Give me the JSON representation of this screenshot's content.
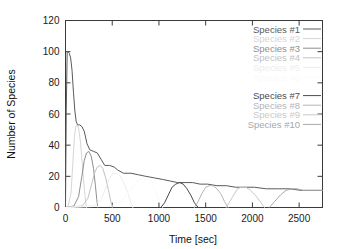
{
  "chart_data": {
    "type": "line",
    "title": "",
    "xlabel": "Time [sec]",
    "ylabel": "Number of Species",
    "xlim": [
      0,
      2750
    ],
    "ylim": [
      0,
      120
    ],
    "xticks": [
      0,
      500,
      1000,
      1500,
      2000,
      2500
    ],
    "yticks": [
      0,
      20,
      40,
      60,
      80,
      100,
      120
    ],
    "grid": false,
    "legend_position": "top-right",
    "series": [
      {
        "name": "Species #1",
        "color": "#5a5a5a",
        "x": [
          0,
          8,
          18,
          28,
          40,
          55,
          70,
          85,
          100,
          115,
          130,
          150,
          175,
          200,
          230,
          260,
          300,
          340,
          380,
          420,
          470,
          520,
          560,
          620,
          700,
          780,
          860,
          950,
          1040,
          1120,
          1200,
          1280,
          1360,
          1440,
          1520,
          1620,
          1720,
          1820,
          1920,
          2020,
          2150,
          2280,
          2400,
          2520,
          2650,
          2750
        ],
        "y": [
          0,
          62,
          100,
          100,
          99,
          96,
          88,
          74,
          62,
          55,
          53,
          53,
          52,
          49,
          41,
          37,
          36,
          35,
          31,
          27,
          27,
          26,
          24,
          22,
          22,
          21,
          20,
          19,
          18,
          17,
          16,
          16,
          16,
          15,
          15,
          14,
          14,
          13,
          13,
          13,
          12,
          12,
          12,
          11,
          11,
          11
        ]
      },
      {
        "name": "Species #2",
        "color": "#d6d6d6",
        "x": [
          0,
          30,
          60,
          80,
          95,
          110,
          125,
          140,
          160,
          180,
          200,
          215,
          225
        ],
        "y": [
          0,
          1,
          10,
          30,
          45,
          52,
          53,
          51,
          42,
          28,
          13,
          4,
          0
        ]
      },
      {
        "name": "Species #3",
        "color": "#8f8f8f",
        "x": [
          0,
          90,
          140,
          175,
          200,
          225,
          250,
          275,
          300,
          320,
          335,
          345
        ],
        "y": [
          0,
          1,
          7,
          20,
          30,
          35,
          36,
          33,
          25,
          14,
          5,
          0
        ]
      },
      {
        "name": "Species #4",
        "color": "#c2c2c2",
        "x": [
          0,
          180,
          240,
          280,
          310,
          340,
          370,
          400,
          430,
          460,
          485,
          500
        ],
        "y": [
          0,
          1,
          6,
          15,
          22,
          26,
          27,
          25,
          19,
          11,
          4,
          0
        ]
      },
      {
        "name": "Species #5",
        "color": "#ededed",
        "x": [
          0,
          300,
          380,
          430,
          470,
          510,
          550,
          590,
          630,
          670,
          700,
          720
        ],
        "y": [
          0,
          1,
          5,
          12,
          19,
          22,
          22,
          20,
          15,
          9,
          3,
          0
        ]
      },
      {
        "name": "Species #6",
        "color": "#fafafa",
        "x": [
          0,
          500,
          600,
          680,
          750,
          820,
          880,
          940,
          1000,
          1040
        ],
        "y": [
          0,
          1,
          4,
          10,
          16,
          19,
          18,
          13,
          5,
          0
        ]
      },
      {
        "name": "Species #7",
        "color": "#4a4a4a",
        "x": [
          1020,
          1060,
          1100,
          1140,
          1180,
          1220,
          1260,
          1300,
          1340,
          1380,
          1420
        ],
        "y": [
          0,
          3,
          8,
          13,
          15,
          16,
          15,
          12,
          8,
          3,
          0
        ]
      },
      {
        "name": "Species #8",
        "color": "#b5b5b5",
        "x": [
          1380,
          1420,
          1460,
          1500,
          1540,
          1580,
          1620,
          1660,
          1700,
          1740
        ],
        "y": [
          0,
          4,
          9,
          13,
          14,
          14,
          12,
          9,
          4,
          0
        ]
      },
      {
        "name": "Species #9",
        "color": "#c9c9c9",
        "x": [
          1720,
          1760,
          1800,
          1840,
          1880,
          1930,
          1980,
          2030,
          2080,
          2130
        ],
        "y": [
          0,
          4,
          8,
          12,
          13,
          13,
          11,
          8,
          4,
          0
        ]
      },
      {
        "name": "Species #10",
        "color": "#a8a8a8",
        "x": [
          2180,
          2240,
          2300,
          2360,
          2420,
          2480,
          2540,
          2600,
          2660,
          2720,
          2750
        ],
        "y": [
          0,
          4,
          8,
          11,
          12,
          12,
          11,
          11,
          11,
          11,
          11
        ]
      }
    ]
  }
}
